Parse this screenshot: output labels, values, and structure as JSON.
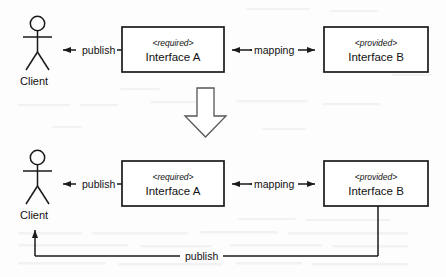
{
  "diagram": {
    "type": "uml-component-diagram",
    "colors": {
      "background": "#fdfdfd",
      "stroke": "#1a1a1a",
      "text": "#111111",
      "box_fill": "#ffffff"
    },
    "panels": [
      {
        "id": "before",
        "actor": {
          "label": "Client"
        },
        "boxes": [
          {
            "id": "interface-a",
            "stereotype": "<required>",
            "name": "Interface A"
          },
          {
            "id": "interface-b",
            "stereotype": "<provided>",
            "name": "Interface B"
          }
        ],
        "edges": [
          {
            "id": "publish-top",
            "label": "publish",
            "from": "interface-a",
            "to": "client",
            "arrow": "single-left"
          },
          {
            "id": "mapping-top",
            "label": "mapping",
            "from": "interface-a",
            "to": "interface-b",
            "arrow": "double"
          }
        ]
      },
      {
        "id": "after",
        "actor": {
          "label": "Client"
        },
        "boxes": [
          {
            "id": "interface-a-2",
            "stereotype": "<required>",
            "name": "Interface A"
          },
          {
            "id": "interface-b-2",
            "stereotype": "<provided>",
            "name": "Interface B"
          }
        ],
        "edges": [
          {
            "id": "publish-bottom-direct",
            "label": "publish",
            "from": "interface-a-2",
            "to": "client-2",
            "arrow": "single-left"
          },
          {
            "id": "mapping-bottom",
            "label": "mapping",
            "from": "interface-a-2",
            "to": "interface-b-2",
            "arrow": "double"
          },
          {
            "id": "publish-routed",
            "label": "publish",
            "from": "interface-b-2",
            "to": "client-2",
            "arrow": "single-up"
          }
        ]
      }
    ],
    "transition": {
      "id": "transition-arrow",
      "icon": "block-arrow-down-icon",
      "direction": "down"
    }
  }
}
